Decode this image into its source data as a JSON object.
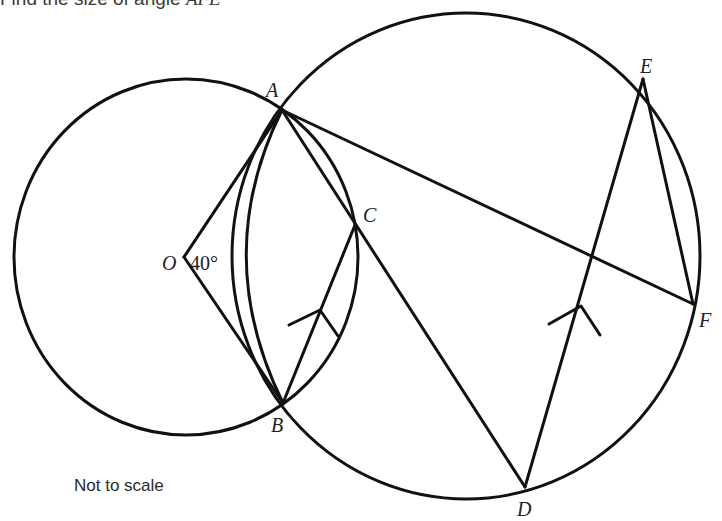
{
  "question": {
    "prefix": "Find the size of angle ",
    "angle_name": "AFE"
  },
  "note": "Not to scale",
  "colors": {
    "stroke": "#111111",
    "text": "#222222",
    "background": "#ffffff"
  },
  "figure": {
    "small_circle": {
      "center_label": "O",
      "cx": 186,
      "cy": 257,
      "rx": 172,
      "ry": 178
    },
    "large_circle": {
      "cx": 466,
      "cy": 256,
      "rx": 234,
      "ry": 243
    },
    "points": {
      "A": {
        "label": "A",
        "x": 282,
        "y": 110
      },
      "B": {
        "label": "B",
        "x": 283,
        "y": 403
      },
      "C": {
        "label": "C",
        "x": 355,
        "y": 225
      },
      "D": {
        "label": "D",
        "x": 525,
        "y": 487
      },
      "E": {
        "label": "E",
        "x": 643,
        "y": 79
      },
      "F": {
        "label": "F",
        "x": 693,
        "y": 304
      },
      "O": {
        "label": "O",
        "x": 184,
        "y": 257
      }
    },
    "segments": [
      "OA",
      "OB",
      "AB",
      "AD",
      "AF",
      "BC",
      "DE",
      "EF"
    ],
    "parallel_marks": [
      "BC",
      "DE"
    ],
    "angle_annotation": {
      "at": "O",
      "text": "40°"
    }
  }
}
